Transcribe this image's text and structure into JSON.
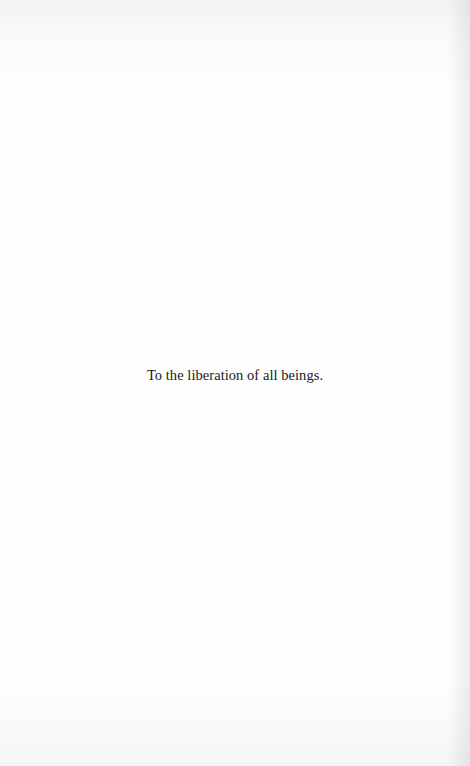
{
  "page": {
    "dedication": "To the liberation of all beings.",
    "background_color": "#fefefe",
    "text_color": "#1a1a1a"
  }
}
